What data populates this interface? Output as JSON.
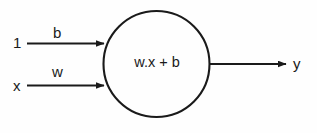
{
  "diagram": {
    "colors": {
      "background": "#fefefe",
      "stroke": "#1a1a1a",
      "text": "#1a1a1a"
    },
    "inputs": [
      {
        "id": "bias-input",
        "value_label": "1",
        "weight_label": "b"
      },
      {
        "id": "signal-input",
        "value_label": "x",
        "weight_label": "w"
      }
    ],
    "neuron": {
      "body_label": "w.x + b",
      "shape": "circle"
    },
    "output": {
      "label": "y"
    },
    "icons": {
      "arrowhead": "arrowhead-icon",
      "neuron": "circle-node-icon"
    }
  }
}
